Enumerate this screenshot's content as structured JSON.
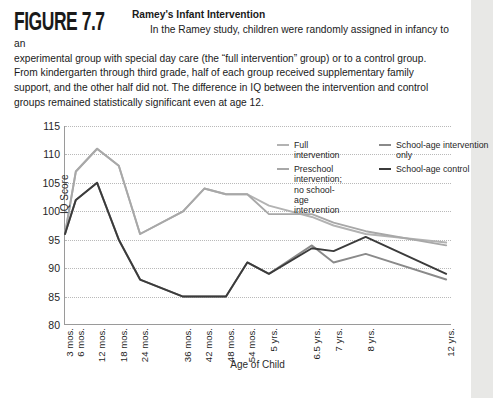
{
  "figure": {
    "number_label": "FIGURE 7.7",
    "title": "Ramey's Infant Intervention",
    "body_line1": "In the Ramey study, children were randomly assigned in infancy to an",
    "body_line2": "experimental group with special day care (the “full intervention” group) or to a control group.",
    "body_line3": "From kindergarten through third grade, half of each group received supplementary family",
    "body_line4": "support, and the other half did not. The difference in IQ between the intervention and control",
    "body_line5": "groups remained statistically significant even at age 12."
  },
  "legend": {
    "position": "top-right-inside-plot",
    "columns": [
      {
        "items": [
          {
            "label": "Full intervention",
            "color": "#b3b3b3"
          },
          {
            "label": "Preschool intervention; no school-age intervention",
            "color": "#a8a8a8"
          }
        ]
      },
      {
        "items": [
          {
            "label": "School-age intervention only",
            "color": "#8a8a8a"
          },
          {
            "label": "School-age control",
            "color": "#3b3b3b"
          }
        ]
      }
    ]
  },
  "chart_data": {
    "type": "line",
    "title": "Ramey's Infant Intervention",
    "xlabel": "Age of Child",
    "ylabel": "IQ Score",
    "ylim": [
      80,
      115
    ],
    "yticks": [
      80,
      85,
      90,
      95,
      100,
      105,
      110,
      115
    ],
    "grid": true,
    "legend_position": "top-right",
    "categories": [
      "3 mos.",
      "6 mos.",
      "12 mos.",
      "18 mos.",
      "24 mos.",
      "36 mos.",
      "42 mos.",
      "48 mos.",
      "54 mos.",
      "5 yrs.",
      "6.5 yrs.",
      "7 yrs.",
      "8 yrs.",
      "12 yrs."
    ],
    "series": [
      {
        "name": "Full intervention",
        "color": "#b3b3b3",
        "values": [
          96,
          107,
          111,
          108,
          96,
          100,
          104,
          103,
          103,
          101,
          99,
          97.5,
          96,
          94.5
        ]
      },
      {
        "name": "Preschool intervention; no school-age intervention",
        "color": "#a8a8a8",
        "values": [
          96,
          107,
          111,
          108,
          96,
          100,
          104,
          103,
          103,
          99.5,
          99.5,
          98,
          96.5,
          94
        ]
      },
      {
        "name": "School-age intervention only",
        "color": "#8a8a8a",
        "values": [
          96,
          102,
          105,
          95,
          88,
          85,
          85,
          85,
          91,
          89,
          94,
          91,
          92.5,
          88
        ]
      },
      {
        "name": "School-age control",
        "color": "#3b3b3b",
        "values": [
          96,
          102,
          105,
          95,
          88,
          85,
          85,
          85,
          91,
          89,
          93.5,
          93,
          95.5,
          89
        ]
      }
    ]
  }
}
